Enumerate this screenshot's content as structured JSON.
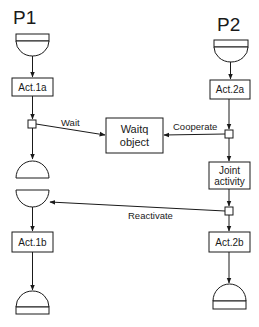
{
  "diagram": {
    "processes": [
      {
        "id": "P1",
        "label": "P1"
      },
      {
        "id": "P2",
        "label": "P2"
      }
    ],
    "activities": {
      "act1a": "Act.1a",
      "act2a": "Act.2a",
      "act1b": "Act.1b",
      "act2b": "Act.2b",
      "joint_line1": "Joint",
      "joint_line2": "activity"
    },
    "waitq": {
      "line1": "Waitq",
      "line2": "object"
    },
    "edges": {
      "wait": "Wait",
      "cooperate": "Cooperate",
      "reactivate": "Reactivate"
    },
    "colors": {
      "stroke": "#1a1a1a",
      "background": "#ffffff"
    }
  }
}
